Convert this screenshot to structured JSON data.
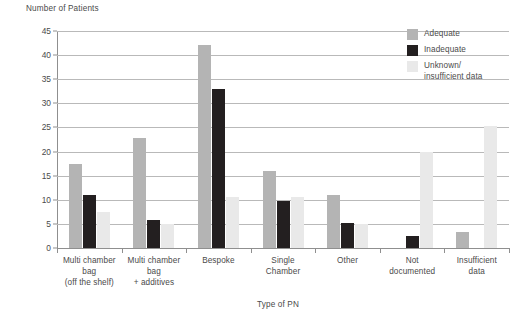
{
  "chart_data": {
    "type": "bar",
    "title": "",
    "ylabel": "Number of Patients",
    "xlabel": "Type of PN",
    "ylim": [
      0,
      45
    ],
    "yticks": [
      0,
      5,
      10,
      15,
      20,
      25,
      30,
      35,
      40,
      45
    ],
    "grid": true,
    "legend_position": "top-right",
    "categories": [
      "Multi chamber\nbag\n(off the shelf)",
      "Multi chamber\nbag\n+ additives",
      "Bespoke",
      "Single\nChamber",
      "Other",
      "Not\ndocumented",
      "Insufficient\ndata"
    ],
    "series": [
      {
        "name": "Adequate",
        "color": "#b4b4b4",
        "values": [
          17.4,
          22.8,
          42,
          16,
          10.9,
          0,
          3.4
        ]
      },
      {
        "name": "Inadequate",
        "color": "#231f20",
        "values": [
          10.9,
          5.8,
          33,
          9.7,
          5.2,
          2.4,
          0
        ]
      },
      {
        "name": "Unknown/\ninsufficient data",
        "color": "#e9e9e9",
        "values": [
          7.5,
          5.0,
          10.5,
          10.6,
          5.0,
          20,
          25.3
        ]
      }
    ]
  }
}
